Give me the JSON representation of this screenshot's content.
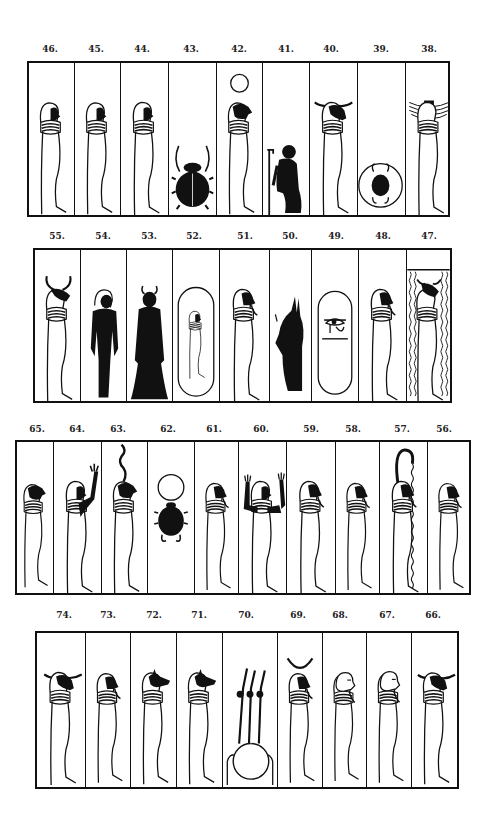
{
  "plate": {
    "rows": [
      {
        "name": "row-1",
        "labels": [
          "46.",
          "45.",
          "44.",
          "43.",
          "42.",
          "41.",
          "40.",
          "39.",
          "38."
        ],
        "figures": [
          {
            "number": "46",
            "type": "mummy",
            "head": "human"
          },
          {
            "number": "45",
            "type": "mummy",
            "head": "human"
          },
          {
            "number": "44",
            "type": "mummy",
            "head": "human"
          },
          {
            "number": "43",
            "type": "scarab"
          },
          {
            "number": "42",
            "type": "mummy",
            "head": "falcon",
            "crown": "sun-disk"
          },
          {
            "number": "41",
            "type": "kneeling-figure"
          },
          {
            "number": "40",
            "type": "mummy",
            "head": "ram",
            "crown": "horizontal-horns"
          },
          {
            "number": "39",
            "type": "scarab-in-disk"
          },
          {
            "number": "38",
            "type": "mummy",
            "head": "winged-headdress"
          }
        ]
      },
      {
        "name": "row-2",
        "labels": [
          "55.",
          "54.",
          "53.",
          "52.",
          "51.",
          "50.",
          "49.",
          "48.",
          "47."
        ],
        "figures": [
          {
            "number": "55",
            "type": "mummy",
            "head": "bull",
            "crown": "horns"
          },
          {
            "number": "54",
            "type": "standing-black-figure"
          },
          {
            "number": "53",
            "type": "standing-black-robed-figure"
          },
          {
            "number": "52",
            "type": "mummy-in-cartouche"
          },
          {
            "number": "51",
            "type": "mummy",
            "head": "human-bearded"
          },
          {
            "number": "50",
            "type": "standing-black-jackal"
          },
          {
            "number": "49",
            "type": "eye-in-cartouche"
          },
          {
            "number": "48",
            "type": "mummy",
            "head": "human-bearded"
          },
          {
            "number": "47",
            "type": "mummy-in-water",
            "head": "bull"
          }
        ]
      },
      {
        "name": "row-3",
        "labels": [
          "65.",
          "64.",
          "63.",
          "62.",
          "61.",
          "60.",
          "59.",
          "58.",
          "57.",
          "56."
        ],
        "figures": [
          {
            "number": "65",
            "type": "mummy",
            "head": "falcon"
          },
          {
            "number": "64",
            "type": "mummy-arm-raised",
            "head": "human"
          },
          {
            "number": "63",
            "type": "mummy",
            "head": "falcon",
            "crown": "serpent"
          },
          {
            "number": "62",
            "type": "scarab-with-disk"
          },
          {
            "number": "61",
            "type": "mummy",
            "head": "human-bearded"
          },
          {
            "number": "60",
            "type": "mummy-arms-raised",
            "head": "human"
          },
          {
            "number": "59",
            "type": "mummy",
            "head": "human-bearded"
          },
          {
            "number": "58",
            "type": "mummy",
            "head": "human-bearded"
          },
          {
            "number": "57",
            "type": "mummy-with-serpent",
            "head": "human-bearded"
          },
          {
            "number": "56",
            "type": "mummy",
            "head": "human-bearded"
          }
        ]
      },
      {
        "name": "row-4",
        "labels": [
          "74.",
          "73.",
          "72.",
          "71.",
          "70.",
          "69.",
          "68.",
          "67.",
          "66."
        ],
        "figures": [
          {
            "number": "74",
            "type": "mummy",
            "head": "ram",
            "crown": "horizontal-horns"
          },
          {
            "number": "73",
            "type": "mummy",
            "head": "human-bearded"
          },
          {
            "number": "72",
            "type": "mummy",
            "head": "jackal"
          },
          {
            "number": "71",
            "type": "mummy",
            "head": "jackal"
          },
          {
            "number": "70",
            "type": "arms-rising-from-disk"
          },
          {
            "number": "69",
            "type": "mummy",
            "head": "human-bearded",
            "crown": "crescent"
          },
          {
            "number": "68",
            "type": "mummy",
            "head": "bald-bearded"
          },
          {
            "number": "67",
            "type": "mummy",
            "head": "bald-bearded"
          },
          {
            "number": "66",
            "type": "mummy",
            "head": "ram",
            "crown": "horizontal-horns"
          }
        ]
      }
    ]
  }
}
